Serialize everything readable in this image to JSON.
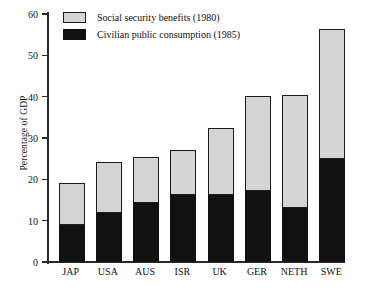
{
  "chart_data": {
    "type": "bar",
    "title": "",
    "xlabel": "",
    "ylabel": "Percentage of GDP",
    "ylim": [
      0,
      60
    ],
    "yticks": [
      0,
      10,
      20,
      30,
      40,
      50,
      60
    ],
    "grid": false,
    "stacked": true,
    "legend_position": "top-left",
    "categories": [
      "JAP",
      "USA",
      "AUS",
      "ISR",
      "UK",
      "GER",
      "NETH",
      "SWE"
    ],
    "series": [
      {
        "name": "Civilian public consumption (1985)",
        "color": "#111111",
        "values": [
          9.0,
          11.9,
          14.2,
          16.1,
          16.1,
          17.2,
          13.0,
          25.0
        ]
      },
      {
        "name": "Social security benefits (1980)",
        "color": "#d4d4d4",
        "values": [
          10.0,
          12.4,
          11.2,
          11.1,
          16.4,
          22.9,
          27.5,
          31.3
        ]
      }
    ],
    "totals": [
      19.0,
      24.3,
      25.4,
      27.2,
      32.5,
      40.1,
      40.5,
      56.3
    ]
  },
  "axis": {
    "y_title": "Percentage of GDP",
    "y_ticks": [
      "0",
      "10",
      "20",
      "30",
      "40",
      "50",
      "60"
    ]
  },
  "legend": {
    "items": [
      {
        "label": "Social security benefits (1980)",
        "swatch": "social-swatch"
      },
      {
        "label": "Civilian public consumption (1985)",
        "swatch": "civilian-swatch"
      }
    ]
  }
}
